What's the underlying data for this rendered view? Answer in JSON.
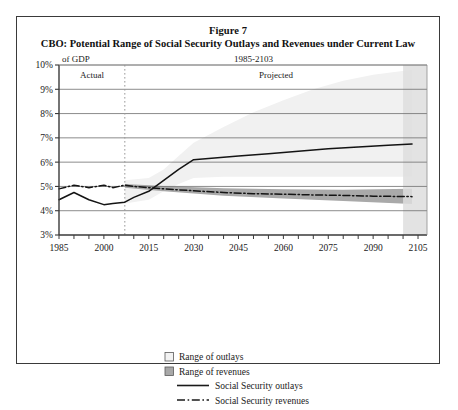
{
  "figure": {
    "number": "Figure 7",
    "title": "CBO: Potential Range of Social Security Outlays and Revenues under Current Law"
  },
  "annotations": {
    "y_axis_unit": "of GDP",
    "period": "1985-2103",
    "actual_label": "Actual",
    "projected_label": "Projected"
  },
  "legend": {
    "items": [
      {
        "label": "Range of outlays",
        "swatch": "outlays-range-swatch",
        "kind": "box",
        "color": "#f2f2f2"
      },
      {
        "label": "Range of revenues",
        "swatch": "revenues-range-swatch",
        "kind": "box",
        "color": "#a8a8a8"
      },
      {
        "label": "Social Security outlays",
        "swatch": "outlays-line-swatch",
        "kind": "solid",
        "color": "#1a1a1a"
      },
      {
        "label": "Social Security revenues",
        "swatch": "revenues-line-swatch",
        "kind": "dashdot",
        "color": "#1a1a1a"
      }
    ]
  },
  "chart_data": {
    "type": "area",
    "title": "CBO: Potential Range of Social Security Outlays and Revenues under Current Law",
    "xlabel": "",
    "ylabel": "of GDP",
    "xlim": [
      1985,
      2108
    ],
    "ylim": [
      3,
      10
    ],
    "ytick_values": [
      3,
      4,
      5,
      6,
      7,
      8,
      9,
      10
    ],
    "ytick_labels": [
      "3%",
      "4%",
      "5%",
      "6%",
      "7%",
      "8%",
      "9%",
      "10%"
    ],
    "xtick_values": [
      1985,
      2000,
      2015,
      2030,
      2045,
      2060,
      2075,
      2090,
      2105
    ],
    "xtick_labels": [
      "1985",
      "2000",
      "2015",
      "2030",
      "2045",
      "2060",
      "2075",
      "2090",
      "2105"
    ],
    "xminor_step": 5,
    "grid": "horizontal",
    "legend_position": "below",
    "divider_year": 2007,
    "series": [
      {
        "name": "Social Security outlays",
        "style": "solid",
        "x": [
          1985,
          1990,
          1995,
          2000,
          2003,
          2007,
          2010,
          2015,
          2020,
          2025,
          2030,
          2035,
          2045,
          2055,
          2065,
          2075,
          2085,
          2095,
          2103
        ],
        "values": [
          4.45,
          4.75,
          4.45,
          4.25,
          4.3,
          4.35,
          4.55,
          4.8,
          5.25,
          5.7,
          6.1,
          6.15,
          6.25,
          6.35,
          6.45,
          6.55,
          6.62,
          6.7,
          6.75
        ]
      },
      {
        "name": "Social Security revenues",
        "style": "dashdot",
        "x": [
          1985,
          1990,
          1995,
          2000,
          2003,
          2007,
          2010,
          2015,
          2020,
          2030,
          2040,
          2050,
          2060,
          2070,
          2080,
          2090,
          2103
        ],
        "values": [
          4.9,
          5.05,
          4.95,
          5.05,
          4.95,
          5.05,
          5.0,
          4.95,
          4.9,
          4.82,
          4.75,
          4.7,
          4.68,
          4.65,
          4.63,
          4.6,
          4.58
        ]
      }
    ],
    "bands": [
      {
        "name": "Range of outlays",
        "fill": "#f1f1f1",
        "x": [
          2007,
          2015,
          2020,
          2025,
          2030,
          2040,
          2050,
          2060,
          2070,
          2080,
          2090,
          2103
        ],
        "upper": [
          5.25,
          5.35,
          5.7,
          6.25,
          6.8,
          7.45,
          8.05,
          8.55,
          9.0,
          9.35,
          9.6,
          9.8
        ],
        "lower": [
          4.3,
          4.45,
          4.8,
          5.1,
          5.35,
          5.4,
          5.4,
          5.4,
          5.4,
          5.4,
          5.4,
          5.4
        ]
      },
      {
        "name": "Range of revenues",
        "fill": "#a9a9a9",
        "x": [
          2007,
          2020,
          2040,
          2060,
          2080,
          2103
        ],
        "upper": [
          5.1,
          5.02,
          4.92,
          4.88,
          4.86,
          4.9
        ],
        "lower": [
          4.95,
          4.8,
          4.62,
          4.5,
          4.4,
          4.28
        ]
      }
    ],
    "end_shade": {
      "from": 2100,
      "to": 2108,
      "fill": "#dedede"
    }
  }
}
